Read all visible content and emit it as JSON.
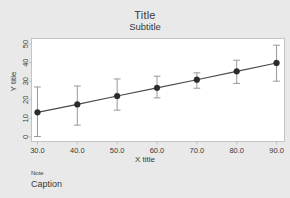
{
  "chart_data": {
    "type": "line",
    "title": "Title",
    "subtitle": "Subtitle",
    "xlabel": "X title",
    "ylabel": "Y title",
    "note": "Note",
    "caption": "Caption",
    "x": [
      30,
      40,
      50,
      60,
      70,
      80,
      90
    ],
    "y": [
      13.2,
      17.5,
      22.0,
      26.4,
      30.8,
      35.3,
      39.8
    ],
    "y_lower": [
      0.2,
      6.3,
      14.4,
      21.0,
      26.2,
      28.8,
      30.0
    ],
    "y_upper": [
      26.9,
      27.4,
      31.2,
      32.7,
      34.5,
      41.3,
      49.4
    ],
    "xlim": [
      28.5,
      92.0
    ],
    "ylim": [
      -2.5,
      53.0
    ],
    "xticks": [
      30,
      40,
      50,
      60,
      70,
      80,
      90
    ],
    "xticklabels": [
      "30.0",
      "40.0",
      "50.0",
      "60.0",
      "70.0",
      "80.0",
      "90.0"
    ],
    "yticks": [
      0,
      10,
      20,
      30,
      40,
      50
    ],
    "yticklabels": [
      "0",
      "10",
      "20",
      "30",
      "40",
      "50"
    ],
    "grid": false,
    "legend": null,
    "series_name": "fitted line with error bars",
    "marker": "filled-circle",
    "colors": {
      "line": "#4a4a4a",
      "marker": "#2b2b2b",
      "errorbar": "#8d8d8d",
      "frame": "#b9b9b9",
      "plot_background": "#ffffff",
      "figure_background": "#e9e9e9",
      "text": "#3a3a3a"
    }
  }
}
